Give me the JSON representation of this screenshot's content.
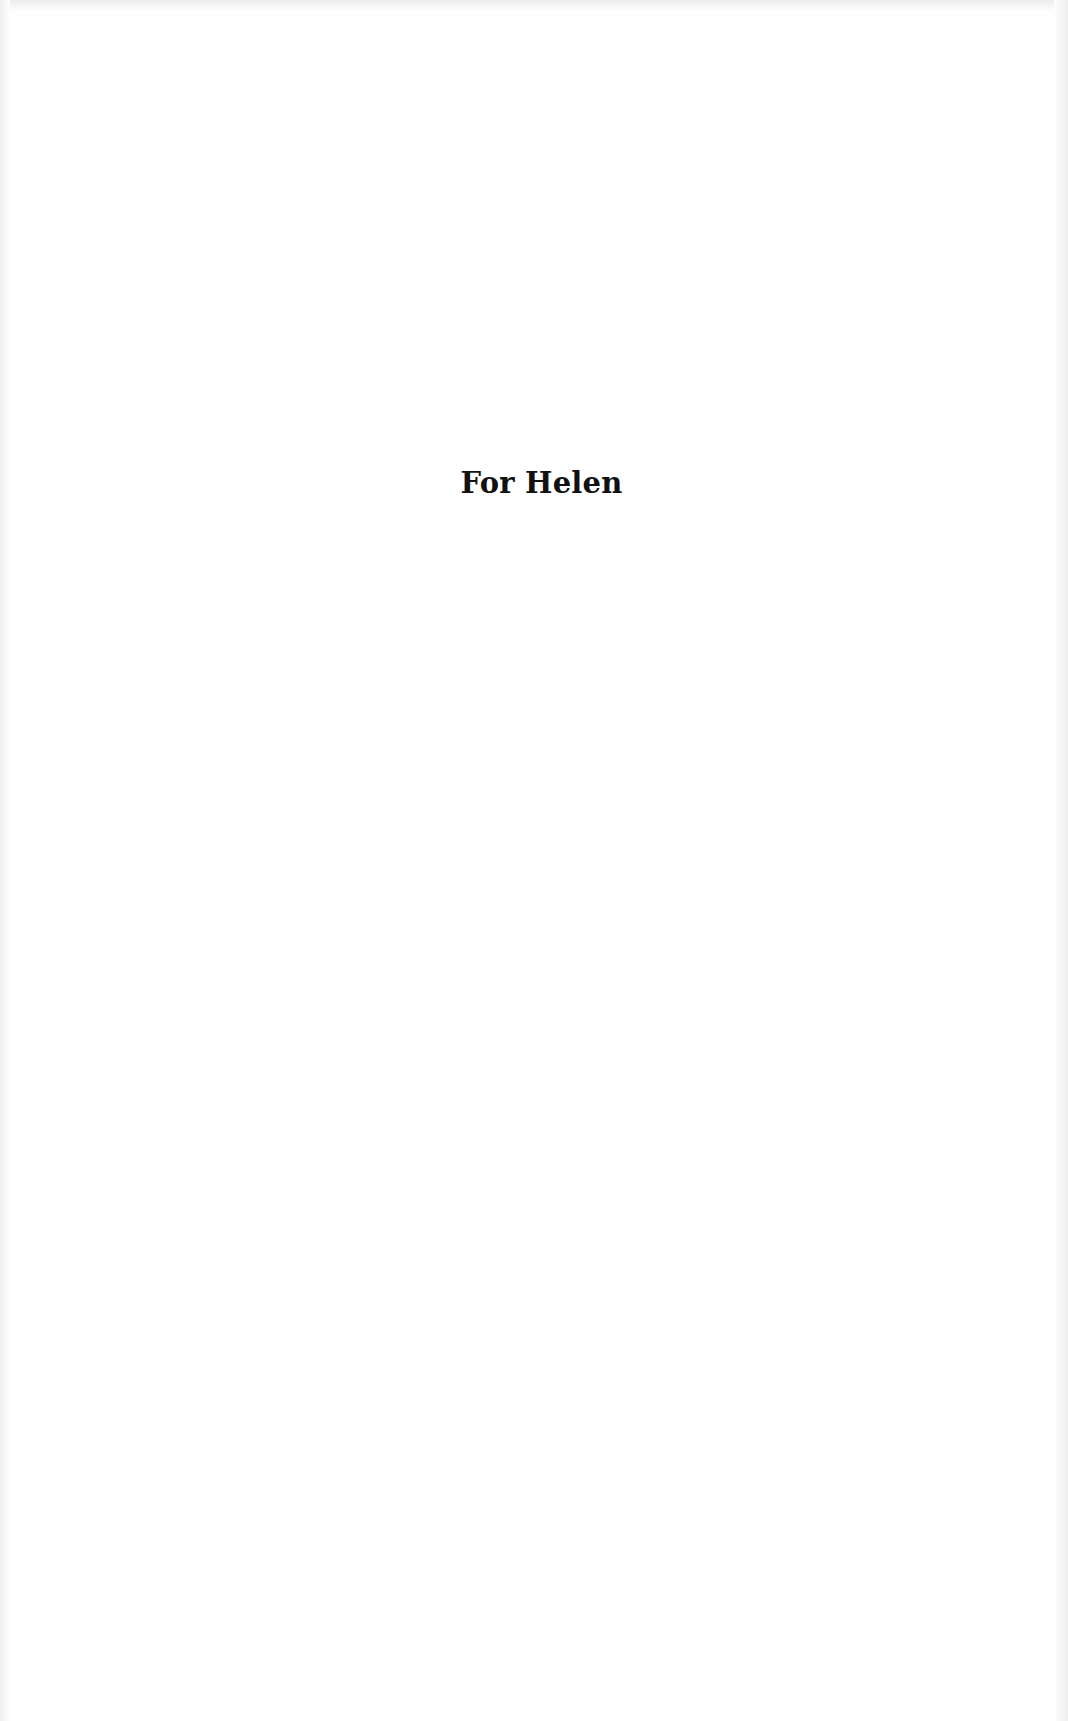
{
  "page": {
    "dedication": "For Helen"
  }
}
